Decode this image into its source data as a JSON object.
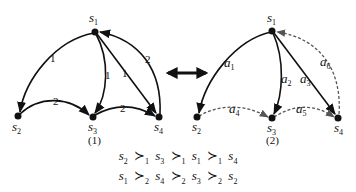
{
  "graph1": {
    "caption": "(1)",
    "nodes": [
      {
        "id": "s1",
        "label": "s",
        "sub": "1",
        "x": 95,
        "y": 32
      },
      {
        "id": "s2",
        "label": "s",
        "sub": "2",
        "x": 18,
        "y": 116
      },
      {
        "id": "s3",
        "label": "s",
        "sub": "3",
        "x": 93,
        "y": 117
      },
      {
        "id": "s4",
        "label": "s",
        "sub": "4",
        "x": 159,
        "y": 117
      }
    ],
    "edges": [
      {
        "from": "s1",
        "to": "s2",
        "weight": "1"
      },
      {
        "from": "s1",
        "to": "s3",
        "weight": "1"
      },
      {
        "from": "s1",
        "to": "s4",
        "weight": "1"
      },
      {
        "from": "s4",
        "to": "s1",
        "weight": "2"
      },
      {
        "from": "s2",
        "to": "s3",
        "weight": "2"
      },
      {
        "from": "s3",
        "to": "s4",
        "weight": "2"
      }
    ]
  },
  "graph2": {
    "caption": "(2)",
    "nodes": [
      {
        "id": "s1",
        "label": "s",
        "sub": "1",
        "x": 272,
        "y": 31
      },
      {
        "id": "s2",
        "label": "s",
        "sub": "2",
        "x": 197,
        "y": 117
      },
      {
        "id": "s3",
        "label": "s",
        "sub": "3",
        "x": 272,
        "y": 118
      },
      {
        "id": "s4",
        "label": "s",
        "sub": "4",
        "x": 338,
        "y": 118
      }
    ],
    "edges": [
      {
        "from": "s1",
        "to": "s2",
        "label": "a",
        "sub": "1",
        "style": "solid"
      },
      {
        "from": "s1",
        "to": "s3",
        "label": "a",
        "sub": "2",
        "style": "solid"
      },
      {
        "from": "s1",
        "to": "s4",
        "label": "a",
        "sub": "3",
        "style": "solid"
      },
      {
        "from": "s2",
        "to": "s3",
        "label": "a",
        "sub": "4",
        "style": "dashed"
      },
      {
        "from": "s3",
        "to": "s4",
        "label": "a",
        "sub": "5",
        "style": "dashed"
      },
      {
        "from": "s4",
        "to": "s1",
        "label": "a",
        "sub": "6",
        "style": "dashed"
      }
    ]
  },
  "connector": {
    "type": "double-arrow"
  },
  "preferences": [
    {
      "agent": "1",
      "order": [
        "2",
        "3",
        "1",
        "4"
      ]
    },
    {
      "agent": "2",
      "order": [
        "1",
        "4",
        "3",
        "2"
      ]
    }
  ],
  "labels": {
    "node_letter": "s",
    "edge_letter": "a",
    "succ_symbol": "≻"
  }
}
